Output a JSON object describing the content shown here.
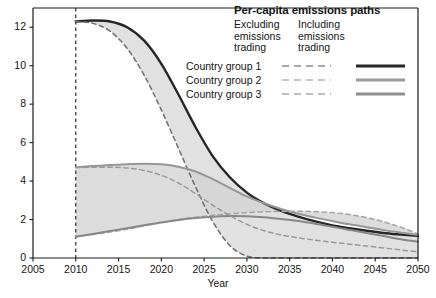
{
  "chart_data": {
    "type": "line",
    "title": "Per-capita emissions paths",
    "xlabel": "Year",
    "ylabel": "",
    "xlim": [
      2005,
      2050
    ],
    "ylim": [
      0,
      13
    ],
    "xticks": [
      2005,
      2010,
      2015,
      2020,
      2025,
      2030,
      2035,
      2040,
      2045,
      2050
    ],
    "yticks": [
      0,
      2,
      4,
      6,
      8,
      10,
      12
    ],
    "grid": false,
    "legend_position": "top-right",
    "annotations": [
      {
        "type": "vertical-dashed-line",
        "x": 2010,
        "label": ""
      }
    ],
    "legend_column_headers": [
      "Excluding emissions trading",
      "Including emissions trading"
    ],
    "x": [
      2010,
      2012,
      2014,
      2016,
      2018,
      2020,
      2022,
      2024,
      2026,
      2028,
      2030,
      2032,
      2034,
      2036,
      2038,
      2040,
      2042,
      2044,
      2046,
      2048,
      2050
    ],
    "series": [
      {
        "name": "Country group 1 — Including emissions trading",
        "group": "Country group 1",
        "style": "solid",
        "color": "#262626",
        "values": [
          12.3,
          12.35,
          12.3,
          12.0,
          11.3,
          10.1,
          8.5,
          6.8,
          5.3,
          4.2,
          3.4,
          2.85,
          2.45,
          2.15,
          1.9,
          1.7,
          1.55,
          1.42,
          1.3,
          1.22,
          1.15
        ]
      },
      {
        "name": "Country group 1 — Excluding emissions trading",
        "group": "Country group 1",
        "style": "dashed",
        "color": "#6e6e6e",
        "values": [
          12.3,
          12.2,
          11.8,
          10.9,
          9.5,
          7.7,
          5.7,
          3.7,
          1.9,
          0.65,
          0.1,
          0.0,
          0.0,
          0.0,
          0.0,
          0.0,
          0.0,
          0.0,
          0.0,
          0.0,
          0.0
        ]
      },
      {
        "name": "Country group 2 — Including emissions trading",
        "group": "Country group 2",
        "style": "solid",
        "color": "#969696",
        "values": [
          4.72,
          4.78,
          4.83,
          4.88,
          4.9,
          4.87,
          4.75,
          4.5,
          4.1,
          3.65,
          3.2,
          2.85,
          2.55,
          2.3,
          2.1,
          1.92,
          1.75,
          1.6,
          1.45,
          1.32,
          1.2
        ]
      },
      {
        "name": "Country group 2 — Excluding emissions trading",
        "group": "Country group 2",
        "style": "dashed",
        "color": "#a5a5a5",
        "values": [
          1.12,
          1.22,
          1.35,
          1.5,
          1.67,
          1.84,
          1.99,
          2.12,
          2.22,
          2.3,
          2.36,
          2.4,
          2.42,
          2.43,
          2.41,
          2.36,
          2.26,
          2.1,
          1.88,
          1.6,
          1.25
        ]
      },
      {
        "name": "Country group 3 — Including emissions trading",
        "group": "Country group 3",
        "style": "solid",
        "color": "#878787",
        "values": [
          1.1,
          1.25,
          1.4,
          1.55,
          1.7,
          1.85,
          1.98,
          2.08,
          2.15,
          2.18,
          2.17,
          2.12,
          2.03,
          1.92,
          1.78,
          1.62,
          1.46,
          1.3,
          1.14,
          0.98,
          0.85
        ]
      },
      {
        "name": "Country group 3 — Excluding emissions trading",
        "group": "Country group 3",
        "style": "dashed",
        "color": "#9a9a9a",
        "values": [
          4.7,
          4.72,
          4.72,
          4.68,
          4.55,
          4.3,
          3.9,
          3.35,
          2.75,
          2.2,
          1.75,
          1.42,
          1.2,
          1.05,
          0.93,
          0.82,
          0.72,
          0.62,
          0.52,
          0.42,
          0.32
        ]
      }
    ],
    "shaded_bands": [
      {
        "between": [
          "Country group 1 — Including emissions trading",
          "Country group 1 — Excluding emissions trading"
        ],
        "color": "#d9d9d9"
      },
      {
        "between": [
          "Country group 2 — Including emissions trading",
          "Country group 2 — Excluding emissions trading"
        ],
        "color": "#d2d2d2"
      }
    ]
  },
  "legend": {
    "title": "Per-capita emissions paths",
    "col1_header": "Excluding emissions trading",
    "col2_header": "Including emissions trading",
    "col1_lines": [
      "Excluding",
      "emissions",
      "trading"
    ],
    "col2_lines": [
      "Including",
      "emissions",
      "trading"
    ],
    "rows": [
      {
        "label": "Country group 1",
        "dash_color": "#8c8c8c",
        "solid_color": "#262626"
      },
      {
        "label": "Country group 2",
        "dash_color": "#b4b4b4",
        "solid_color": "#9b9b9b"
      },
      {
        "label": "Country group 3",
        "dash_color": "#a8a8a8",
        "solid_color": "#8e8e8e"
      }
    ]
  },
  "axes": {
    "x_title": "Year",
    "x_ticks": [
      "2005",
      "2010",
      "2015",
      "2020",
      "2025",
      "2030",
      "2035",
      "2040",
      "2045",
      "2050"
    ],
    "y_ticks": [
      "12",
      "10",
      "8",
      "6",
      "4",
      "2",
      "0"
    ]
  }
}
